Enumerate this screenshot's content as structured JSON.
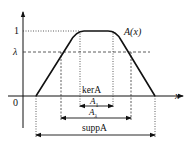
{
  "diagram": {
    "type": "fuzzy-set-membership",
    "function_label": "A(x)",
    "x_axis_label": "x",
    "origin_label": "0",
    "y_ticks": [
      {
        "label": "1",
        "level": 1
      },
      {
        "label": "λ",
        "level": "lambda"
      }
    ],
    "intervals": [
      {
        "name": "kernel",
        "label": "kerA",
        "sub_label": "A",
        "sub": "1"
      },
      {
        "name": "lambda-cut",
        "label": "A",
        "sub": "λ"
      },
      {
        "name": "support",
        "label": "suppA"
      }
    ]
  },
  "labels": {
    "one": "1",
    "lambda": "λ",
    "zero": "0",
    "x": "x",
    "ax": "A(x)",
    "ker": "kerA",
    "a1_main": "A",
    "a1_sub": "1",
    "al_main": "A",
    "al_sub": "λ",
    "supp": "suppA"
  }
}
